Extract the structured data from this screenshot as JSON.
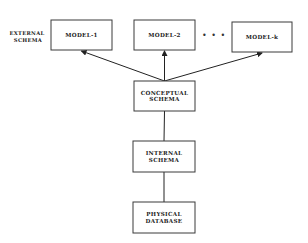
{
  "diagram": {
    "external_schema_label": [
      "EXTERNAL",
      "SCHEMA"
    ],
    "ellipsis": "• • •",
    "nodes": [
      {
        "id": "model1",
        "lines": [
          "MODEL-1"
        ]
      },
      {
        "id": "model2",
        "lines": [
          "MODEL-2"
        ]
      },
      {
        "id": "modelk",
        "lines": [
          "MODEL-k"
        ]
      },
      {
        "id": "conceptual",
        "lines": [
          "CONCEPTUAL",
          "SCHEMA"
        ]
      },
      {
        "id": "internal",
        "lines": [
          "INTERNAL",
          "SCHEMA"
        ]
      },
      {
        "id": "physical",
        "lines": [
          "PHYSICAL",
          "DATABASE"
        ]
      }
    ],
    "edges": [
      {
        "from": "conceptual",
        "to": "model1",
        "arrow": true
      },
      {
        "from": "conceptual",
        "to": "model2",
        "arrow": true
      },
      {
        "from": "conceptual",
        "to": "modelk",
        "arrow": true
      },
      {
        "from": "conceptual",
        "to": "internal",
        "arrow": false
      },
      {
        "from": "internal",
        "to": "physical",
        "arrow": false
      }
    ],
    "colors": {
      "line": "#222222",
      "box_border": "#3a3a3a",
      "background": "#ffffff"
    }
  }
}
